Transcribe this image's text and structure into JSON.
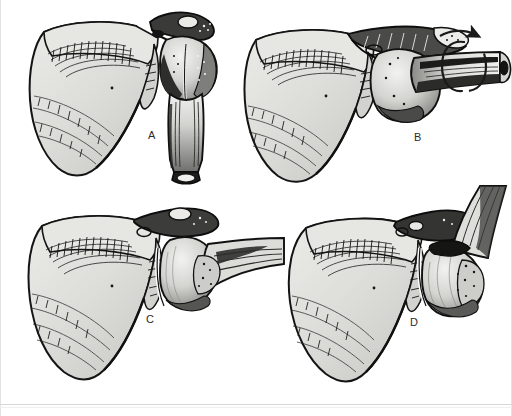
{
  "figure": {
    "background_color": "#ffffff",
    "ink_color": "#1a1a1a",
    "bone_fill": "#d9d9d6",
    "bone_fill_light": "#ebebe8",
    "bone_fill_dark": "#8d8d8a",
    "shadow_color": "#2a2a2a",
    "label_color": "#2b2b2b",
    "width": 512,
    "height": 416
  },
  "panels": [
    {
      "id": "A",
      "label": "A",
      "label_x": 145,
      "label_y": 132,
      "caption": "Normal glenohumeral relationship, humerus hanging in neutral adduction",
      "structures": [
        "scapula",
        "spine-of-scapula",
        "acromion",
        "coracoid-process",
        "glenoid-fossa",
        "humeral-head",
        "greater-tuberosity",
        "humeral-shaft"
      ],
      "humerus_orientation": "vertical, inferior"
    },
    {
      "id": "B",
      "label": "B",
      "label_x": 414,
      "label_y": 132,
      "caption": "Humerus abducted to horizontal and externally rotated; arrow indicates axial rotation of shaft",
      "structures": [
        "scapula",
        "spine-of-scapula",
        "acromion",
        "glenoid-fossa",
        "humeral-head",
        "humeral-shaft",
        "rotation-arrow"
      ],
      "humerus_orientation": "horizontal, lateral",
      "annotation": "rotation-arrow"
    },
    {
      "id": "C",
      "label": "C",
      "label_x": 145,
      "label_y": 317,
      "caption": "Humeral head levered forward out of the glenoid fossa; early anterior subluxation",
      "structures": [
        "scapula",
        "spine-of-scapula",
        "acromion",
        "glenoid-fossa",
        "humeral-head",
        "humeral-shaft"
      ],
      "humerus_orientation": "horizontal, abducted"
    },
    {
      "id": "D",
      "label": "D",
      "label_x": 410,
      "label_y": 317,
      "caption": "Completed anterior dislocation with humerus elevated, head displaced beneath the coracoid",
      "structures": [
        "scapula",
        "spine-of-scapula",
        "acromion",
        "glenoid-fossa",
        "humeral-head",
        "humeral-shaft"
      ],
      "humerus_orientation": "elevated, superolateral"
    }
  ],
  "annotations": {
    "rotation_arrow": {
      "name": "rotation-arrow",
      "type": "circular-arrow",
      "meaning": "axial rotation of the humeral shaft",
      "panel": "B"
    }
  },
  "rules": {
    "bottom_rule_visible": true,
    "left_edge_visible": true,
    "right_edge_visible": true
  }
}
